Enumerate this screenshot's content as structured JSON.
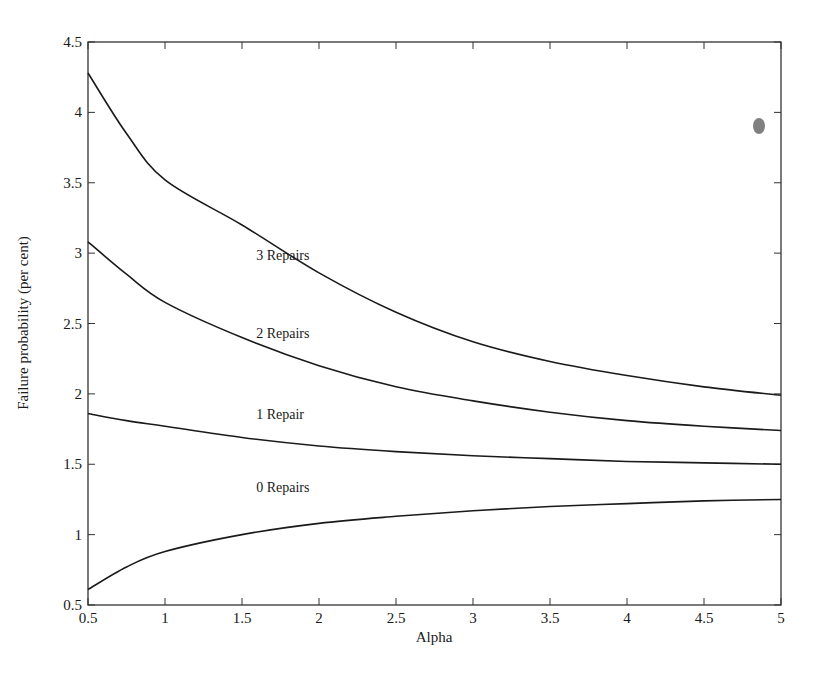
{
  "chart_data": {
    "type": "line",
    "title": "",
    "xlabel": "Alpha",
    "ylabel": "Failure probability (per cent)",
    "xlim": [
      0.5,
      5
    ],
    "ylim": [
      0.5,
      4.5
    ],
    "grid": false,
    "legend_position": "inline-labels",
    "x_ticks": [
      "0.5",
      "1",
      "1.5",
      "2",
      "2.5",
      "3",
      "3.5",
      "4",
      "4.5",
      "5"
    ],
    "y_ticks": [
      "0.5",
      "1",
      "1.5",
      "2",
      "2.5",
      "3",
      "3.5",
      "4",
      "4.5"
    ],
    "x": [
      0.5,
      0.75,
      1.0,
      1.5,
      2.0,
      2.5,
      3.0,
      3.5,
      4.0,
      4.5,
      5.0
    ],
    "series": [
      {
        "name": "3 Repairs",
        "label_pos": [
          1.8,
          2.95
        ],
        "values": [
          4.28,
          3.85,
          3.52,
          3.2,
          2.86,
          2.58,
          2.37,
          2.23,
          2.13,
          2.05,
          1.99
        ]
      },
      {
        "name": "2 Repairs",
        "label_pos": [
          1.8,
          2.4
        ],
        "values": [
          3.08,
          2.85,
          2.65,
          2.4,
          2.2,
          2.05,
          1.95,
          1.87,
          1.81,
          1.77,
          1.74
        ]
      },
      {
        "name": "1 Repair",
        "label_pos": [
          1.8,
          1.82
        ],
        "values": [
          1.86,
          1.81,
          1.77,
          1.69,
          1.63,
          1.59,
          1.56,
          1.54,
          1.52,
          1.51,
          1.5
        ]
      },
      {
        "name": "0 Repairs",
        "label_pos": [
          1.8,
          1.3
        ],
        "values": [
          0.61,
          0.77,
          0.88,
          1.0,
          1.08,
          1.13,
          1.17,
          1.2,
          1.22,
          1.24,
          1.25
        ]
      }
    ]
  },
  "style": {
    "line_color": "#1a1a1a",
    "axis_color": "#333333",
    "background": "#ffffff"
  }
}
